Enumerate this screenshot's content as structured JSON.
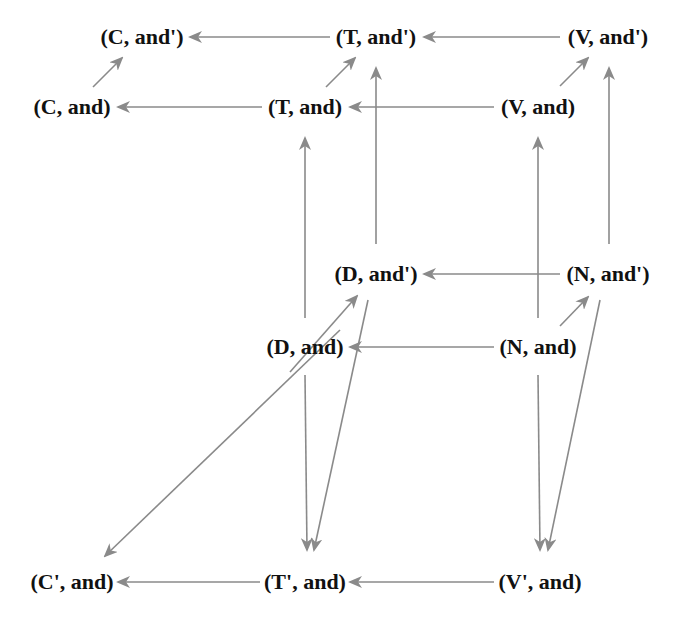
{
  "diagram": {
    "type": "directed-graph",
    "edge_color": "#8a8a8a",
    "node_text_color": "#111111",
    "nodes": [
      {
        "id": "C_and_p",
        "label": "(C, and')",
        "x": 142,
        "y": 37
      },
      {
        "id": "T_and_p",
        "label": "(T, and')",
        "x": 376,
        "y": 37
      },
      {
        "id": "V_and_p",
        "label": "(V, and')",
        "x": 608,
        "y": 37
      },
      {
        "id": "C_and",
        "label": "(C, and)",
        "x": 72,
        "y": 107
      },
      {
        "id": "T_and",
        "label": "(T, and)",
        "x": 305,
        "y": 107
      },
      {
        "id": "V_and",
        "label": "(V, and)",
        "x": 538,
        "y": 107
      },
      {
        "id": "D_and_p",
        "label": "(D, and')",
        "x": 376,
        "y": 274
      },
      {
        "id": "N_and_p",
        "label": "(N, and')",
        "x": 608,
        "y": 274
      },
      {
        "id": "D_and",
        "label": "(D, and)",
        "x": 305,
        "y": 347
      },
      {
        "id": "N_and",
        "label": "(N, and)",
        "x": 538,
        "y": 347
      },
      {
        "id": "Cp_and",
        "label": "(C', and)",
        "x": 72,
        "y": 582
      },
      {
        "id": "Tp_and",
        "label": "(T', and)",
        "x": 305,
        "y": 582
      },
      {
        "id": "Vp_and",
        "label": "(V', and)",
        "x": 540,
        "y": 582
      }
    ],
    "edges": [
      {
        "from": "T_and_p",
        "to": "C_and_p",
        "x1": 330,
        "y1": 37,
        "x2": 190,
        "y2": 37
      },
      {
        "from": "V_and_p",
        "to": "T_and_p",
        "x1": 560,
        "y1": 37,
        "x2": 424,
        "y2": 37
      },
      {
        "from": "T_and",
        "to": "C_and",
        "x1": 262,
        "y1": 107,
        "x2": 118,
        "y2": 107
      },
      {
        "from": "V_and",
        "to": "T_and",
        "x1": 494,
        "y1": 107,
        "x2": 350,
        "y2": 107
      },
      {
        "from": "C_and",
        "to": "C_and_p",
        "x1": 93,
        "y1": 87,
        "x2": 122,
        "y2": 58
      },
      {
        "from": "T_and",
        "to": "T_and_p",
        "x1": 326,
        "y1": 87,
        "x2": 355,
        "y2": 58
      },
      {
        "from": "V_and",
        "to": "V_and_p",
        "x1": 560,
        "y1": 86,
        "x2": 588,
        "y2": 58
      },
      {
        "from": "D_and_p",
        "to": "T_and_p",
        "x1": 376,
        "y1": 244,
        "x2": 376,
        "y2": 68
      },
      {
        "from": "N_and_p",
        "to": "V_and_p",
        "x1": 609,
        "y1": 244,
        "x2": 609,
        "y2": 68
      },
      {
        "from": "D_and",
        "to": "T_and",
        "x1": 305,
        "y1": 318,
        "x2": 305,
        "y2": 138
      },
      {
        "from": "N_and",
        "to": "V_and",
        "x1": 538,
        "y1": 318,
        "x2": 538,
        "y2": 138
      },
      {
        "from": "N_and_p",
        "to": "D_and_p",
        "x1": 560,
        "y1": 274,
        "x2": 424,
        "y2": 274
      },
      {
        "from": "N_and",
        "to": "D_and",
        "x1": 494,
        "y1": 347,
        "x2": 350,
        "y2": 347
      },
      {
        "from": "N_and",
        "to": "N_and_p",
        "x1": 560,
        "y1": 326,
        "x2": 588,
        "y2": 297
      },
      {
        "from": "C_and_p_src",
        "to": "D_and_p",
        "x1": 290,
        "y1": 372,
        "x2": 357,
        "y2": 296
      },
      {
        "from": "D_and_p",
        "to": "Cp_and",
        "x1": 340,
        "y1": 330,
        "x2": 105,
        "y2": 556
      },
      {
        "from": "D_and",
        "to": "Tp_and",
        "x1": 305,
        "y1": 375,
        "x2": 307,
        "y2": 550
      },
      {
        "from": "D_and_p",
        "to": "Tp_and",
        "x1": 368,
        "y1": 300,
        "x2": 314,
        "y2": 550
      },
      {
        "from": "N_and",
        "to": "Vp_and",
        "x1": 538,
        "y1": 375,
        "x2": 540,
        "y2": 550
      },
      {
        "from": "N_and_p",
        "to": "Vp_and",
        "x1": 600,
        "y1": 300,
        "x2": 548,
        "y2": 550
      },
      {
        "from": "Tp_and",
        "to": "Cp_and",
        "x1": 260,
        "y1": 582,
        "x2": 118,
        "y2": 582
      },
      {
        "from": "Vp_and",
        "to": "Tp_and",
        "x1": 494,
        "y1": 582,
        "x2": 350,
        "y2": 582
      }
    ]
  }
}
